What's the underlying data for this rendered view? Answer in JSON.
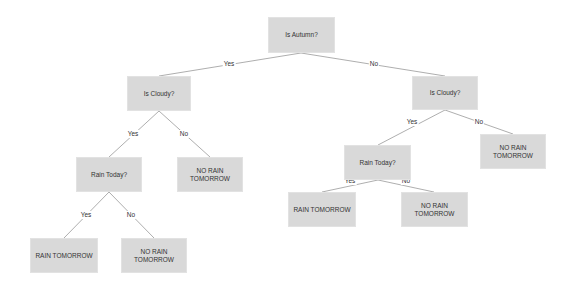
{
  "diagram": {
    "type": "decision-tree",
    "colors": {
      "node_fill": "#d9d9d9",
      "edge": "#999999",
      "text": "#333333",
      "background": "#ffffff"
    },
    "nodes": {
      "root": {
        "label": "Is Autumn?"
      },
      "left_cloudy": {
        "label": "Is Cloudy?"
      },
      "right_cloudy": {
        "label": "Is Cloudy?"
      },
      "left_rain_today": {
        "label": "Rain Today?"
      },
      "left_no_rain": {
        "label": "NO RAIN\nTOMORROW"
      },
      "right_rain_today": {
        "label": "Rain Today?"
      },
      "right_no_rain": {
        "label": "NO RAIN\nTOMORROW"
      },
      "ll_rain": {
        "label": "RAIN TOMORROW"
      },
      "ll_no_rain": {
        "label": "NO RAIN\nTOMORROW"
      },
      "rl_rain": {
        "label": "RAIN TOMORROW"
      },
      "rl_no_rain": {
        "label": "NO RAIN\nTOMORROW"
      }
    },
    "edges": [
      {
        "from": "root",
        "to": "left_cloudy",
        "label": "Yes"
      },
      {
        "from": "root",
        "to": "right_cloudy",
        "label": "No"
      },
      {
        "from": "left_cloudy",
        "to": "left_rain_today",
        "label": "Yes"
      },
      {
        "from": "left_cloudy",
        "to": "left_no_rain",
        "label": "No"
      },
      {
        "from": "right_cloudy",
        "to": "right_rain_today",
        "label": "Yes"
      },
      {
        "from": "right_cloudy",
        "to": "right_no_rain",
        "label": "No"
      },
      {
        "from": "left_rain_today",
        "to": "ll_rain",
        "label": "Yes"
      },
      {
        "from": "left_rain_today",
        "to": "ll_no_rain",
        "label": "No"
      },
      {
        "from": "right_rain_today",
        "to": "rl_rain",
        "label": "Yes"
      },
      {
        "from": "right_rain_today",
        "to": "rl_no_rain",
        "label": "No"
      }
    ]
  }
}
